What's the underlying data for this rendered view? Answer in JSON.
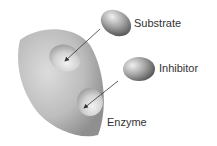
{
  "diagram": {
    "labels": {
      "substrate": "Substrate",
      "inhibitor": "Inhibitor",
      "enzyme": "Enzyme"
    },
    "colors": {
      "shape_fill": "#b8b8b8",
      "shape_dark": "#8a8a8a",
      "site_light": "#e6e6e6",
      "arrow": "#333333",
      "text": "#333333"
    }
  }
}
